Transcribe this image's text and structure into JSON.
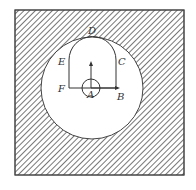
{
  "labels": {
    "A": "A",
    "B": "B",
    "C": "C",
    "D": "D",
    "E": "E",
    "F": "F"
  },
  "colors": {
    "hatch": "#555555",
    "border": "#444444",
    "background": "#ffffff"
  }
}
